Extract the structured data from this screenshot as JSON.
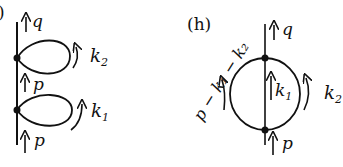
{
  "diagram_g": {
    "label_partial": ")",
    "top_momentum": "q",
    "loop2_momentum": "k",
    "loop2_sub": "2",
    "mid_momentum": "p",
    "loop1_momentum": "k",
    "loop1_sub": "1",
    "bottom_momentum": "p"
  },
  "diagram_h": {
    "label": "(h)",
    "top_momentum": "q",
    "bottom_momentum": "p",
    "center_momentum": "k",
    "center_sub": "1",
    "right_momentum": "k",
    "right_sub": "2",
    "left_momentum": "p − k₁ − k₂"
  },
  "colors": {
    "ink": "#111111",
    "background": "#ffffff"
  }
}
